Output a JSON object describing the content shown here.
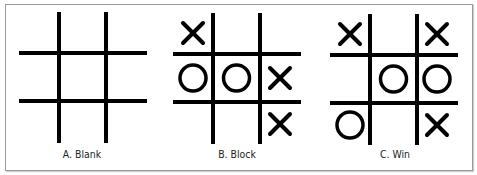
{
  "figure": {
    "panels": [
      {
        "label": "A. Blank",
        "cells": [
          "",
          "",
          "",
          "",
          "",
          "",
          "",
          "",
          ""
        ]
      },
      {
        "label": "B. Block",
        "cells": [
          "X",
          "",
          "",
          "O",
          "O",
          "X",
          "",
          "",
          "X"
        ]
      },
      {
        "label": "C. Win",
        "cells": [
          "X",
          "",
          "X",
          "",
          "O",
          "O",
          "O",
          "",
          "X"
        ]
      }
    ],
    "colors": {
      "line": "#000000",
      "border": "#9a9a9a",
      "background": "#ffffff"
    }
  }
}
